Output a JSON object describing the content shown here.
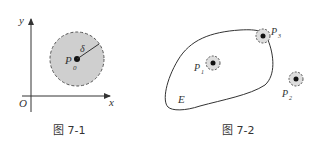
{
  "figure1": {
    "caption": "图 7-1",
    "axis_x_label": "x",
    "axis_y_label": "y",
    "origin_label": "O",
    "point_label": "P",
    "point_subscript": "0",
    "radius_label": "δ"
  },
  "figure2": {
    "caption": "图 7-2",
    "region_label": "E",
    "points": [
      {
        "label": "P",
        "sub": "1"
      },
      {
        "label": "P",
        "sub": "2"
      },
      {
        "label": "P",
        "sub": "3"
      }
    ]
  },
  "colors": {
    "neighborhood_fill": "#cfcfcf",
    "stroke": "#333333"
  }
}
